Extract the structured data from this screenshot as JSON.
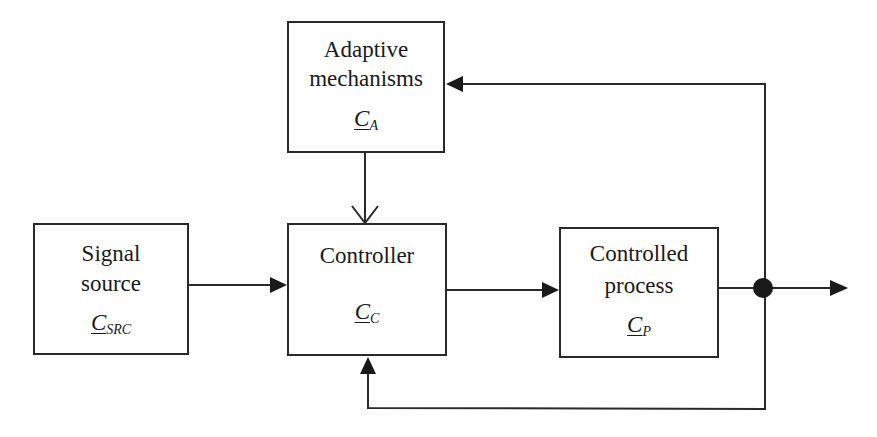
{
  "diagram": {
    "type": "adaptive control block diagram",
    "blocks": [
      {
        "id": "adaptive",
        "lines": [
          "Adaptive",
          "mechanisms"
        ],
        "symbol": "C",
        "subscript": "A"
      },
      {
        "id": "source",
        "lines": [
          "Signal",
          "source"
        ],
        "symbol": "C",
        "subscript": "SRC"
      },
      {
        "id": "controller",
        "lines": [
          "Controller"
        ],
        "symbol": "C",
        "subscript": "C"
      },
      {
        "id": "process",
        "lines": [
          "Controlled",
          "process"
        ],
        "symbol": "C",
        "subscript": "P"
      }
    ],
    "connections": [
      {
        "from": "source",
        "to": "controller",
        "arrow": "filled"
      },
      {
        "from": "adaptive",
        "to": "controller",
        "arrow": "open"
      },
      {
        "from": "controller",
        "to": "process",
        "arrow": "filled"
      },
      {
        "from": "process",
        "to": "output",
        "arrow": "filled",
        "junction": true
      },
      {
        "from": "junction",
        "to": "adaptive",
        "arrow": "filled",
        "label": "feedback to adaptive mechanisms"
      },
      {
        "from": "junction",
        "to": "controller",
        "arrow": "filled",
        "label": "feedback to controller (bottom)"
      }
    ],
    "colors": {
      "line": "#2a2a2a",
      "background": "#ffffff"
    }
  }
}
